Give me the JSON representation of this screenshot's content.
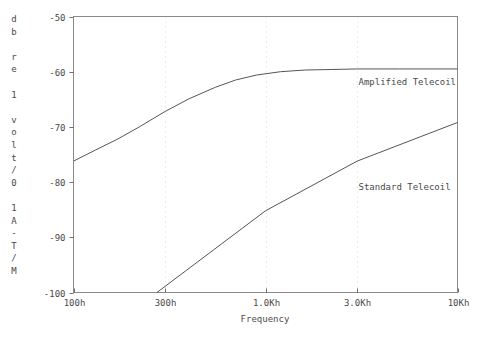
{
  "chart_data": {
    "type": "line",
    "title": "",
    "xlabel": "Frequency",
    "ylabel": "db re 1 volt/0.1 A-T/M",
    "ylabel_chars": [
      "d",
      "b",
      "",
      "r",
      "e",
      "",
      "1",
      "",
      "v",
      "o",
      "l",
      "t",
      "/",
      "0",
      "",
      "1",
      "A",
      "-",
      "T",
      "/",
      "M"
    ],
    "xscale": "log",
    "xlim": [
      100,
      10000
    ],
    "ylim": [
      -100,
      -50
    ],
    "grid": "vertical-dotted",
    "legend": "inline-annotations",
    "xticks": [
      {
        "value": 100,
        "label": "100h"
      },
      {
        "value": 300,
        "label": "300h"
      },
      {
        "value": 1000,
        "label": "1.0Kh"
      },
      {
        "value": 3000,
        "label": "3.0Kh"
      },
      {
        "value": 10000,
        "label": "10Kh"
      }
    ],
    "yticks": [
      {
        "value": -50,
        "label": "-50"
      },
      {
        "value": -60,
        "label": "-60"
      },
      {
        "value": -70,
        "label": "-70"
      },
      {
        "value": -80,
        "label": "-80"
      },
      {
        "value": -90,
        "label": "-90"
      },
      {
        "value": -100,
        "label": "-100"
      }
    ],
    "series": [
      {
        "name": "Amplified Telecoil",
        "label": "Amplified Telecoil",
        "label_at": {
          "x": 3050,
          "y": -61.8
        },
        "color": "#555555",
        "points": [
          [
            100,
            -76.2
          ],
          [
            130,
            -74.2
          ],
          [
            170,
            -72.2
          ],
          [
            220,
            -70.0
          ],
          [
            300,
            -67.2
          ],
          [
            400,
            -64.9
          ],
          [
            550,
            -62.8
          ],
          [
            700,
            -61.5
          ],
          [
            900,
            -60.6
          ],
          [
            1200,
            -60.0
          ],
          [
            1600,
            -59.7
          ],
          [
            2200,
            -59.6
          ],
          [
            3000,
            -59.5
          ],
          [
            5000,
            -59.5
          ],
          [
            10000,
            -59.5
          ]
        ]
      },
      {
        "name": "Standard Telecoil",
        "label": "Standard Telecoil",
        "label_at": {
          "x": 3050,
          "y": -80.8
        },
        "color": "#555555",
        "points": [
          [
            272,
            -100.0
          ],
          [
            1000,
            -85.2
          ],
          [
            3000,
            -76.2
          ],
          [
            10000,
            -69.2
          ]
        ]
      }
    ]
  },
  "axes": {
    "x_title": "Frequency"
  }
}
